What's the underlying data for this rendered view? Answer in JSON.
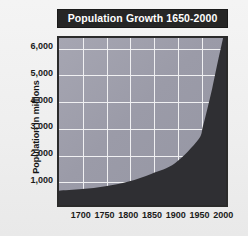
{
  "chart_data": {
    "type": "area",
    "title": "Population Growth 1650-2000",
    "xlabel": "",
    "ylabel": "Population in millions",
    "xlim": [
      1650,
      2010
    ],
    "ylim": [
      0,
      6400
    ],
    "grid": true,
    "legend": null,
    "x": [
      1650,
      1700,
      1750,
      1800,
      1850,
      1900,
      1950,
      1960,
      1970,
      1980,
      1990,
      2000
    ],
    "values": [
      550,
      610,
      720,
      900,
      1200,
      1600,
      2500,
      3000,
      3700,
      4450,
      5300,
      6100
    ],
    "series": [
      {
        "name": "World population",
        "values": [
          550,
          610,
          720,
          900,
          1200,
          1600,
          2500,
          3000,
          3700,
          4450,
          5300,
          6100
        ]
      }
    ],
    "ytick_labels": [
      "6,000",
      "5,000",
      "4,000",
      "3,000",
      "2,000",
      "1,000"
    ],
    "ytick_values": [
      6000,
      5000,
      4000,
      3000,
      2000,
      1000
    ],
    "xtick_labels": [
      "1700",
      "1750",
      "1800",
      "1850",
      "1900",
      "1950",
      "2000"
    ],
    "xtick_values": [
      1700,
      1750,
      1800,
      1850,
      1900,
      1950,
      2000
    ],
    "colors": {
      "area_fill": "#2f2f33",
      "plot_background": "#9d9daa",
      "gridline": "#f0f0f2",
      "title_bar": "#262626",
      "title_text": "#ffffff",
      "axis_text": "#1b1b1b",
      "frame": "#2b2b2b",
      "page_background": "#f0f0f0"
    }
  }
}
